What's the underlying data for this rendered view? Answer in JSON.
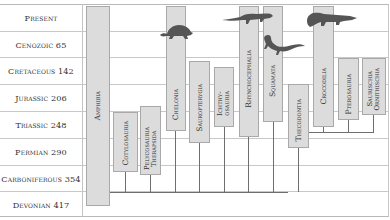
{
  "timeline": {
    "periods": [
      {
        "label": "Present"
      },
      {
        "label": "Cenozoic 65"
      },
      {
        "label": "Cretaceous 142"
      },
      {
        "label": "Jurassic 206"
      },
      {
        "label": "Triassic 248"
      },
      {
        "label": "Permian 290"
      },
      {
        "label": "Carboniferous 354"
      },
      {
        "label": "Devonian 417"
      }
    ]
  },
  "taxa": [
    {
      "label": "Amphibia"
    },
    {
      "label": "Cotylosauria"
    },
    {
      "label": "Pelycosauria",
      "label2": "Therapsida"
    },
    {
      "label": "Chelonia"
    },
    {
      "label": "Sauropterygia"
    },
    {
      "label": "Ichthy-",
      "label2": "osauria"
    },
    {
      "label": "Rhynchocephalia"
    },
    {
      "label": "Squamata"
    },
    {
      "label": "Thecodontia"
    },
    {
      "label": "Crocodilia"
    },
    {
      "label": "Pterosauria"
    },
    {
      "label": "Saurischia",
      "label2": "Ornithischia"
    }
  ],
  "illustrations": [
    {
      "icon": "turtle-icon"
    },
    {
      "icon": "tuatara-icon"
    },
    {
      "icon": "lizard-icon"
    },
    {
      "icon": "crocodile-icon"
    }
  ],
  "colors": {
    "box_fill": "#dcdcdc",
    "box_border": "#a9a9a9",
    "line": "#6e6e6e",
    "grid": "#c8c8c8",
    "silhouette": "#555555"
  }
}
